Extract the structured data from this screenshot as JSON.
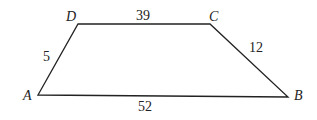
{
  "figure": {
    "type": "trapezoid",
    "vertices": {
      "A": "A",
      "B": "B",
      "C": "C",
      "D": "D"
    },
    "sides": {
      "DC": "39",
      "CB": "12",
      "AB": "52",
      "AD": "5"
    },
    "stroke_color": "#222222"
  }
}
